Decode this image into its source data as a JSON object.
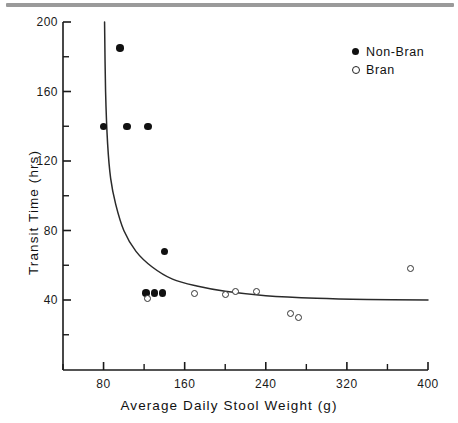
{
  "chart_data": {
    "type": "scatter",
    "title": "",
    "xlabel": "Average Daily Stool Weight (g)",
    "ylabel": "Transit Time (hrs)",
    "xlim": [
      40,
      400
    ],
    "ylim": [
      0,
      200
    ],
    "xticks": [
      80,
      160,
      240,
      320,
      400
    ],
    "yticks": [
      40,
      80,
      120,
      160,
      200
    ],
    "xminorticks": [
      40,
      120,
      200,
      280,
      360
    ],
    "yminorticks": [
      20,
      60,
      100,
      140,
      180
    ],
    "xtick_labels": [
      "80",
      "160",
      "240",
      "320",
      "400"
    ],
    "ytick_labels": [
      "40",
      "80",
      "120",
      "160",
      "200"
    ],
    "grid": false,
    "legend_position": "top-right",
    "series": [
      {
        "name": "Non-Bran",
        "marker": "filled-circle",
        "color": "#111111",
        "points": [
          {
            "x": 96,
            "y": 185
          },
          {
            "x": 80,
            "y": 140
          },
          {
            "x": 103,
            "y": 140
          },
          {
            "x": 124,
            "y": 140
          },
          {
            "x": 140,
            "y": 68
          },
          {
            "x": 122,
            "y": 44
          },
          {
            "x": 130,
            "y": 44
          },
          {
            "x": 138,
            "y": 44
          }
        ]
      },
      {
        "name": "Bran",
        "marker": "open-circle",
        "color": "#333333",
        "points": [
          {
            "x": 123,
            "y": 41
          },
          {
            "x": 170,
            "y": 44
          },
          {
            "x": 200,
            "y": 43
          },
          {
            "x": 210,
            "y": 45
          },
          {
            "x": 231,
            "y": 45
          },
          {
            "x": 264,
            "y": 32
          },
          {
            "x": 272,
            "y": 30
          },
          {
            "x": 383,
            "y": 58
          }
        ]
      }
    ],
    "fit_curve": {
      "name": "hyperbolic-fit",
      "description": "decaying curve asymptoting near 40 hrs",
      "points": [
        {
          "x": 81,
          "y": 200
        },
        {
          "x": 82,
          "y": 160
        },
        {
          "x": 84,
          "y": 130
        },
        {
          "x": 87,
          "y": 110
        },
        {
          "x": 92,
          "y": 95
        },
        {
          "x": 100,
          "y": 80
        },
        {
          "x": 112,
          "y": 68
        },
        {
          "x": 128,
          "y": 59
        },
        {
          "x": 148,
          "y": 52
        },
        {
          "x": 172,
          "y": 48
        },
        {
          "x": 200,
          "y": 45
        },
        {
          "x": 240,
          "y": 42.5
        },
        {
          "x": 290,
          "y": 41
        },
        {
          "x": 340,
          "y": 40.3
        },
        {
          "x": 400,
          "y": 40
        }
      ]
    }
  },
  "legend": {
    "items": [
      {
        "label": "Non-Bran",
        "marker": "filled-circle"
      },
      {
        "label": "Bran",
        "marker": "open-circle"
      }
    ]
  },
  "axes": {
    "x_title": "Average Daily Stool Weight (g)",
    "y_title": "Transit Time (hrs)"
  },
  "colors": {
    "axis": "#1a1a1a",
    "curve": "#2a2a2a",
    "filled_marker": "#111111",
    "open_marker": "#333333",
    "scan_bar": "#9a9a9a"
  }
}
